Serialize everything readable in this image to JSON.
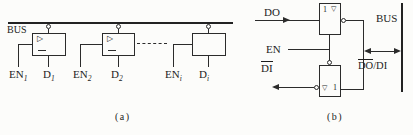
{
  "panel_a": {
    "bus_label": "BUS",
    "caption": "(a)",
    "buffer_symbol": "▷",
    "buffers": [
      {
        "en_base": "EN",
        "en_sub": "1",
        "d_base": "D",
        "d_sub": "1"
      },
      {
        "en_base": "EN",
        "en_sub": "2",
        "d_base": "D",
        "d_sub": "2"
      },
      {
        "en_base": "EN",
        "en_sub": "i",
        "d_base": "D",
        "d_sub": "i"
      }
    ]
  },
  "panel_b": {
    "do_label": "DO",
    "en_label": "EN",
    "di_label": "DI",
    "bus_label": "BUS",
    "bus_signal_overlined": "DO",
    "bus_signal_plain": "/DI",
    "gate_one_symbol": "1",
    "tristate_symbol": "▽",
    "caption": "(b)"
  },
  "colors": {
    "ink": "#2b2b2b",
    "paper": "#fcfcfa"
  }
}
